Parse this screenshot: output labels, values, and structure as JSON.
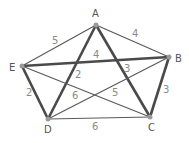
{
  "diagram": {
    "type": "weighted-graph",
    "nodes": [
      {
        "id": "A",
        "label": "A",
        "x": 96,
        "y": 25,
        "lx": 92,
        "ly": 17
      },
      {
        "id": "B",
        "label": "B",
        "x": 169,
        "y": 57,
        "lx": 175,
        "ly": 62
      },
      {
        "id": "C",
        "label": "C",
        "x": 150,
        "y": 117,
        "lx": 148,
        "ly": 131
      },
      {
        "id": "D",
        "label": "D",
        "x": 48,
        "y": 119,
        "lx": 44,
        "ly": 133
      },
      {
        "id": "E",
        "label": "E",
        "x": 22,
        "y": 66,
        "lx": 9,
        "ly": 71
      }
    ],
    "edges": [
      {
        "from": "A",
        "to": "E",
        "weight": "5",
        "thick": false,
        "lx": 52,
        "ly": 44
      },
      {
        "from": "A",
        "to": "B",
        "weight": "4",
        "thick": false,
        "lx": 132,
        "ly": 37
      },
      {
        "from": "E",
        "to": "B",
        "weight": "4",
        "thick": true,
        "lx": 93,
        "ly": 58
      },
      {
        "from": "A",
        "to": "D",
        "weight": "2",
        "thick": true,
        "lx": 75,
        "ly": 78
      },
      {
        "from": "A",
        "to": "C",
        "weight": "3",
        "thick": true,
        "lx": 124,
        "ly": 72
      },
      {
        "from": "E",
        "to": "D",
        "weight": "2",
        "thick": true,
        "lx": 26,
        "ly": 96
      },
      {
        "from": "B",
        "to": "C",
        "weight": "3",
        "thick": true,
        "lx": 163,
        "ly": 93
      },
      {
        "from": "E",
        "to": "C",
        "weight": "6",
        "thick": false,
        "lx": 72,
        "ly": 99
      },
      {
        "from": "D",
        "to": "B",
        "weight": "5",
        "thick": false,
        "lx": 112,
        "ly": 96
      },
      {
        "from": "D",
        "to": "C",
        "weight": "6",
        "thick": false,
        "lx": 92,
        "ly": 130
      }
    ]
  }
}
